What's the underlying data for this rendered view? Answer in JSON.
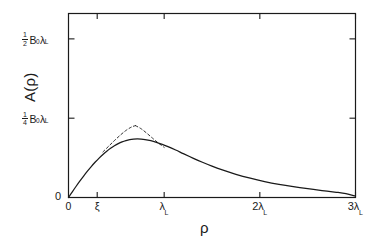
{
  "figure": {
    "background_color": "#ffffff",
    "line_color": "#1a1a1a"
  },
  "axes": {
    "y_title": "A(ρ)",
    "x_title": "ρ"
  },
  "yticks": [
    {
      "name": "half-b0-lambda",
      "frac_num": "1",
      "frac_den": "2",
      "body": "B",
      "body_sub": "0",
      "tail": "λ",
      "tail_sub": "L",
      "value": 0.5
    },
    {
      "name": "quarter-b0-lambda",
      "frac_num": "1",
      "frac_den": "4",
      "body": "B",
      "body_sub": "0",
      "tail": "λ",
      "tail_sub": "L",
      "value": 0.25
    },
    {
      "name": "zero",
      "plain": "0",
      "value": 0
    }
  ],
  "xticks": [
    {
      "name": "zero",
      "plain": "0",
      "value": 0
    },
    {
      "name": "xi",
      "sym": "ξ",
      "value": 0.3
    },
    {
      "name": "lambda-l",
      "sym": "λ",
      "sub": "L",
      "value": 1
    },
    {
      "name": "two-lambda-l",
      "prefix": "2",
      "sym": "λ",
      "sub": "L",
      "value": 2
    },
    {
      "name": "three-lambda-l",
      "prefix": "3",
      "sym": "λ",
      "sub": "L",
      "value": 3
    }
  ],
  "chart_data": {
    "type": "line",
    "title": "",
    "xlabel": "ρ",
    "ylabel": "A(ρ)",
    "xlim": [
      0,
      3
    ],
    "ylim": [
      0,
      0.58
    ],
    "x_tick_labels": [
      "0",
      "ξ",
      "λ_L",
      "2λ_L",
      "3λ_L"
    ],
    "x_tick_values": [
      0,
      0.3,
      1,
      2,
      3
    ],
    "y_tick_labels": [
      "0",
      "1/4 B_0λ_L",
      "1/2 B_0λ_L"
    ],
    "y_tick_values": [
      0,
      0.25,
      0.5
    ],
    "y_unit": "B_0λ_L",
    "grid": false,
    "legend": null,
    "series": [
      {
        "name": "A(rho) exact",
        "style": "solid",
        "x": [
          0.0,
          0.04,
          0.08,
          0.12,
          0.16,
          0.2,
          0.24,
          0.28,
          0.32,
          0.36,
          0.4,
          0.44,
          0.48,
          0.52,
          0.56,
          0.6,
          0.64,
          0.68,
          0.72,
          0.76,
          0.8,
          0.86,
          0.92,
          0.98,
          1.04,
          1.12,
          1.2,
          1.3,
          1.4,
          1.5,
          1.6,
          1.75,
          1.9,
          2.05,
          2.2,
          2.35,
          2.5,
          2.65,
          2.8,
          2.9,
          3.0
        ],
        "y": [
          0.0,
          0.018,
          0.0355,
          0.0523,
          0.0684,
          0.0838,
          0.0983,
          0.1118,
          0.1243,
          0.1357,
          0.146,
          0.1551,
          0.163,
          0.1697,
          0.1752,
          0.1794,
          0.1824,
          0.1842,
          0.1848,
          0.1843,
          0.1828,
          0.179,
          0.1738,
          0.1675,
          0.1604,
          0.1497,
          0.1383,
          0.1243,
          0.111,
          0.0988,
          0.0878,
          0.0732,
          0.0608,
          0.0503,
          0.0415,
          0.0341,
          0.0277,
          0.022,
          0.0165,
          0.012,
          0.0045
        ]
      },
      {
        "name": "small-rho asymptote",
        "style": "dashed",
        "x": [
          0.36,
          0.42,
          0.48,
          0.54,
          0.6,
          0.66,
          0.7
        ],
        "y": [
          0.1438,
          0.1617,
          0.1794,
          0.1962,
          0.2112,
          0.2224,
          0.2265
        ]
      },
      {
        "name": "large-rho asymptote",
        "style": "dashed",
        "x": [
          0.7,
          0.76,
          0.82,
          0.88,
          0.94,
          1.0
        ],
        "y": [
          0.2265,
          0.2165,
          0.2022,
          0.1866,
          0.1716,
          0.158
        ]
      }
    ]
  }
}
